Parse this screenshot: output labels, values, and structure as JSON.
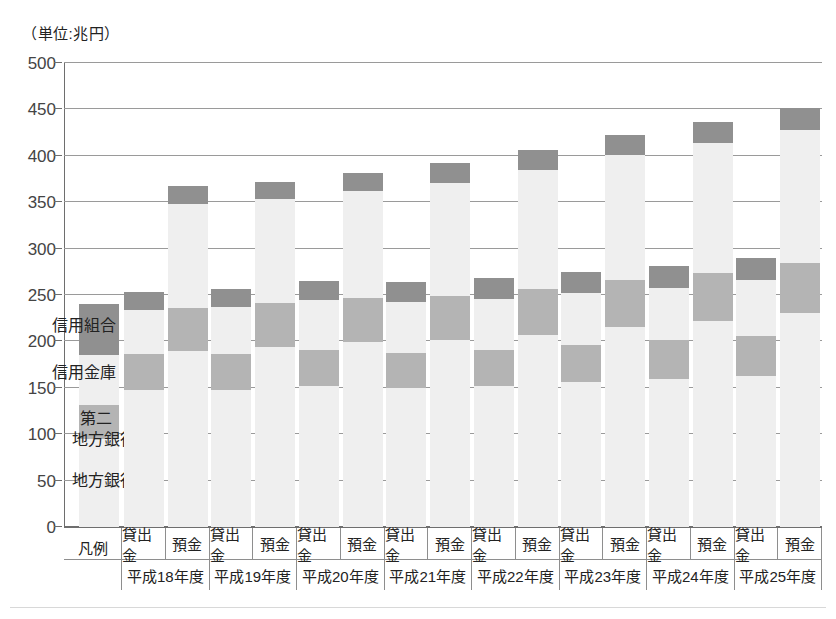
{
  "unit_label": "（単位:兆円）",
  "legend_column_label": "凡例",
  "legend_entries": [
    {
      "name": "信用組合",
      "color": "#909090"
    },
    {
      "name": "信用金庫",
      "color": "#efefef"
    },
    {
      "name": "第二\n地方銀行",
      "line1": "第二",
      "line2": "地方銀行",
      "color": "#b4b4b4"
    },
    {
      "name": "地方銀行",
      "color": "#efefef"
    }
  ],
  "series_labels": {
    "loans": "貸出金",
    "deposits": "預金"
  },
  "chart_data": {
    "type": "bar",
    "title": "",
    "xlabel": "",
    "ylabel": "",
    "unit": "兆円",
    "ylim": [
      0,
      500
    ],
    "ytick_step": 50,
    "ytick_labels": [
      "0",
      "50",
      "100",
      "150",
      "200",
      "250",
      "300",
      "350",
      "400",
      "450",
      "500"
    ],
    "grid": true,
    "stacked": true,
    "legend_position": "in-plot-left",
    "categories": [
      "平成18年度",
      "平成19年度",
      "平成20年度",
      "平成21年度",
      "平成22年度",
      "平成23年度",
      "平成24年度",
      "平成25年度"
    ],
    "subcategories": [
      "貸出金",
      "預金"
    ],
    "stack_order_bottom_to_top": [
      "地方銀行",
      "第二地方銀行",
      "信用金庫",
      "信用組合"
    ],
    "series": [
      {
        "name": "地方銀行",
        "color": "#efefef",
        "loans": [
          148,
          148,
          152,
          150,
          152,
          156,
          160,
          163
        ],
        "deposits": [
          190,
          194,
          199,
          201,
          207,
          216,
          222,
          231
        ]
      },
      {
        "name": "第二地方銀行",
        "color": "#b4b4b4",
        "loans": [
          38,
          38,
          39,
          38,
          39,
          40,
          41,
          43
        ],
        "deposits": [
          46,
          47,
          48,
          48,
          49,
          50,
          52,
          54
        ]
      },
      {
        "name": "信用金庫",
        "color": "#efefef",
        "loans": [
          48,
          51,
          54,
          55,
          55,
          56,
          57,
          60
        ],
        "deposits": [
          112,
          113,
          115,
          122,
          129,
          135,
          140,
          143
        ]
      },
      {
        "name": "信用組合",
        "color": "#909090",
        "loans": [
          19,
          20,
          20,
          21,
          22,
          23,
          23,
          24
        ],
        "deposits": [
          19,
          18,
          19,
          21,
          21,
          22,
          22,
          23
        ]
      }
    ],
    "totals": {
      "loans": [
        253,
        257,
        265,
        264,
        268,
        275,
        281,
        290
      ],
      "deposits": [
        367,
        372,
        381,
        392,
        406,
        423,
        436,
        451
      ]
    }
  }
}
